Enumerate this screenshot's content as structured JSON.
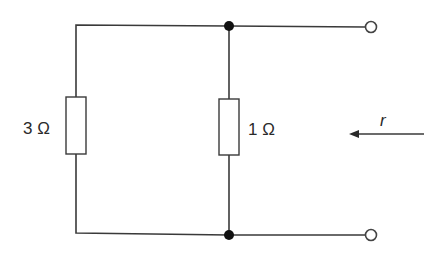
{
  "diagram": {
    "type": "circuit",
    "components": [
      {
        "id": "R1",
        "kind": "resistor",
        "label": "3 Ω",
        "value": "3",
        "unit": "Ω"
      },
      {
        "id": "R2",
        "kind": "resistor",
        "label": "1 Ω",
        "value": "1",
        "unit": "Ω"
      }
    ],
    "junctions": [
      {
        "id": "top-junction"
      },
      {
        "id": "bottom-junction"
      }
    ],
    "terminals": [
      {
        "id": "top-terminal"
      },
      {
        "id": "bottom-terminal"
      }
    ],
    "arrow": {
      "label": "r",
      "direction": "left"
    }
  },
  "colors": {
    "wire": "#3a3a3a",
    "junction": "#111111",
    "background": "#ffffff"
  }
}
